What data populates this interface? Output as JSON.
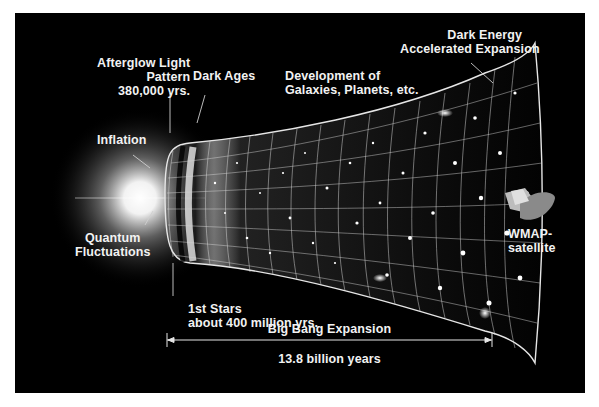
{
  "diagram": {
    "title": "Big Bang Expansion",
    "duration": "13.8 billion years",
    "labels": {
      "afterglow": [
        "Afterglow Light",
        "Pattern",
        "380,000 yrs."
      ],
      "dark_ages": [
        "Dark Ages"
      ],
      "development": [
        "Development of",
        "Galaxies, Planets, etc."
      ],
      "dark_energy": [
        "Dark Energy",
        "Accelerated Expansion"
      ],
      "inflation": [
        "Inflation"
      ],
      "quantum": [
        "Quantum",
        "Fluctuations"
      ],
      "first_stars": [
        "1st Stars",
        "about 400 million yrs."
      ],
      "wmap": [
        "WMAP-",
        "satellite"
      ]
    },
    "colors": {
      "background": "#000000",
      "frame": "#ffffff",
      "text": "#f2f2f2",
      "grid": "#d8d8d8"
    }
  }
}
